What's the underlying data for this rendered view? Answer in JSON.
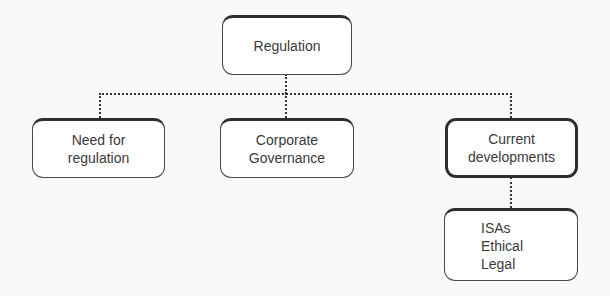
{
  "diagram": {
    "type": "hierarchy",
    "root": {
      "label": "Regulation"
    },
    "children": [
      {
        "lines": [
          "Need for",
          "regulation"
        ]
      },
      {
        "lines": [
          "Corporate",
          "Governance"
        ]
      },
      {
        "lines": [
          "Current",
          "developments"
        ]
      }
    ],
    "grandchild": {
      "parent": "Current developments",
      "lines": [
        "ISAs",
        "Ethical",
        "Legal"
      ]
    },
    "connector_style": "dotted",
    "colors": {
      "background": "#f9f9f8",
      "box_fill": "#ffffff",
      "box_border": "#2e2e2e",
      "text": "#3a3a3a",
      "connector": "#333333"
    }
  }
}
